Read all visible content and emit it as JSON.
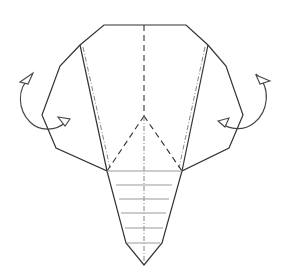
{
  "diagram": {
    "type": "origami-fold-step",
    "line_color": "#333333",
    "legend_line_types": [
      "edge",
      "valley-fold",
      "mountain-fold",
      "hidden-layer"
    ],
    "instruction_arrows": [
      {
        "side": "left",
        "kind": "mountain-fold-behind"
      },
      {
        "side": "right",
        "kind": "mountain-fold-behind"
      }
    ]
  }
}
